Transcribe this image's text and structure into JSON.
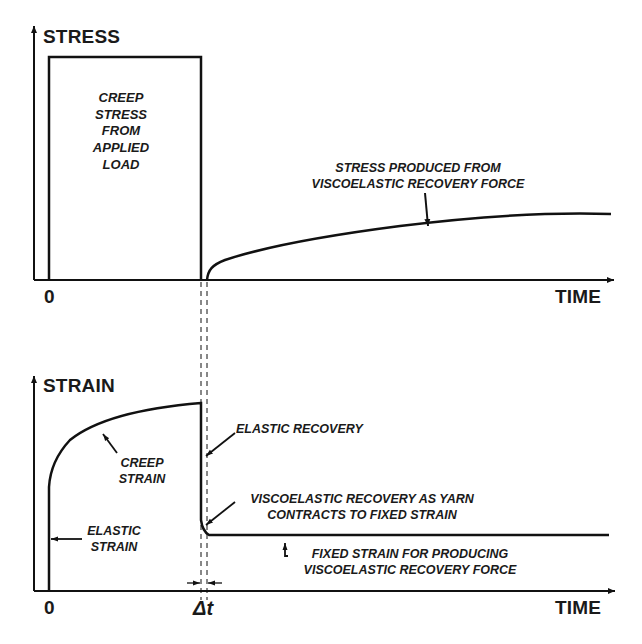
{
  "top_chart": {
    "y_axis_label": "STRESS",
    "x_axis_label": "TIME",
    "origin_label": "0",
    "box_label_lines": [
      "CREEP",
      "STRESS",
      "FROM",
      "APPLIED",
      "LOAD"
    ],
    "curve_label_lines": [
      "STRESS PRODUCED FROM",
      "VISCOELASTIC RECOVERY FORCE"
    ]
  },
  "bottom_chart": {
    "y_axis_label": "STRAIN",
    "x_axis_label": "TIME",
    "origin_label": "0",
    "delta_label": "Δt",
    "creep_strain_lines": [
      "CREEP",
      "STRAIN"
    ],
    "elastic_strain_lines": [
      "ELASTIC",
      "STRAIN"
    ],
    "elastic_recovery_label": "ELASTIC RECOVERY",
    "viscoelastic_recovery_lines": [
      "VISCOELASTIC RECOVERY AS YARN",
      "CONTRACTS TO FIXED STRAIN"
    ],
    "fixed_strain_lines": [
      "FIXED STRAIN FOR PRODUCING",
      "VISCOELASTIC RECOVERY FORCE"
    ]
  },
  "colors": {
    "line": "#111111",
    "background": "#ffffff"
  }
}
